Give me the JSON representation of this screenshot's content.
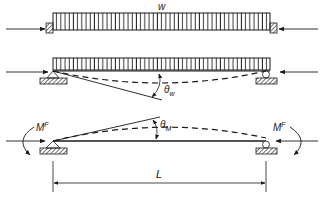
{
  "diagram": {
    "panels": [
      {
        "id": "fixed-end-beam-loaded",
        "load_label": "w",
        "description": "Beam under uniform load w with fixed ends and axial compressive forces"
      },
      {
        "id": "simply-supported-load-rotation",
        "rotation_label": "θ",
        "rotation_sub": "w",
        "description": "Simply supported beam under uniform load; end rotation θw with sagging deflected shape"
      },
      {
        "id": "simply-supported-moment-rotation",
        "moment_label_left": "M",
        "moment_sup_left": "F",
        "moment_label_right": "M",
        "moment_sup_right": "F",
        "rotation_label": "θ",
        "rotation_sub": "M",
        "span_label": "L",
        "description": "Simply supported beam under end moments MF; end rotation θM with hogging deflected shape"
      }
    ],
    "colors": {
      "line": "#1a1a1a",
      "background": "#ffffff"
    }
  }
}
